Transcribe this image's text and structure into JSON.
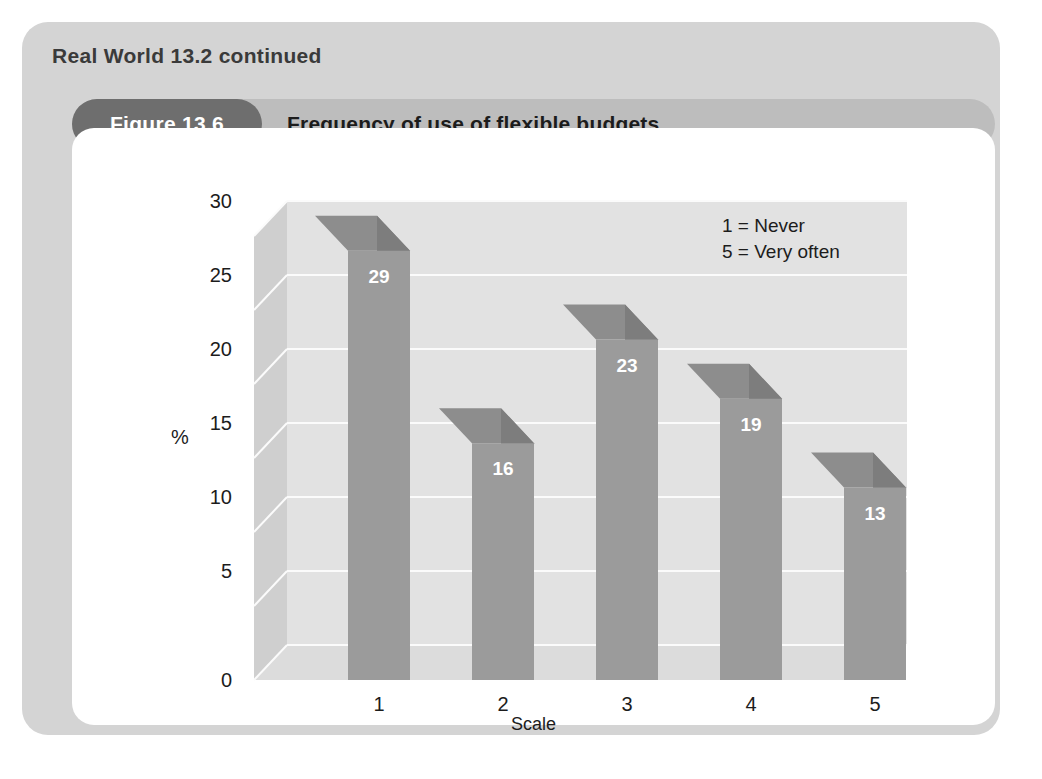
{
  "card": {
    "heading": "Real World 13.2 continued"
  },
  "figure": {
    "tag": "Figure 13.6",
    "title": "Frequency of use of flexible budgets"
  },
  "colors": {
    "card_bg": "#d4d4d4",
    "titlebar_bg": "#bdbdbd",
    "tag_bg": "#6e6e6e",
    "panel_bg": "#ffffff",
    "bar_face": "#9b9b9b",
    "bar_side": "#7d7d7d",
    "bar_top": "#8d8d8d",
    "back_wall": "#e2e2e2",
    "left_wall": "#cfcfcf",
    "floor": "#dcdcdc",
    "gridline": "#fafafa",
    "value_label": "#ffffff",
    "text": "#1c1c1c"
  },
  "chart_data": {
    "type": "bar",
    "title": "Frequency of use of flexible budgets",
    "categories": [
      "1",
      "2",
      "3",
      "4",
      "5"
    ],
    "values": [
      29,
      16,
      23,
      19,
      13
    ],
    "value_labels": [
      "29",
      "16",
      "23",
      "19",
      "13"
    ],
    "xlabel": "Scale",
    "ylabel": "%",
    "ylim": [
      0,
      30
    ],
    "yticks": [
      0,
      5,
      10,
      15,
      20,
      25,
      30
    ],
    "ytick_labels": [
      "0",
      "5",
      "10",
      "15",
      "20",
      "25",
      "30"
    ],
    "grid": true,
    "legend_position": "top-right",
    "annotations": [
      "1 = Never",
      "5 = Very often"
    ],
    "style": "3d-column"
  }
}
